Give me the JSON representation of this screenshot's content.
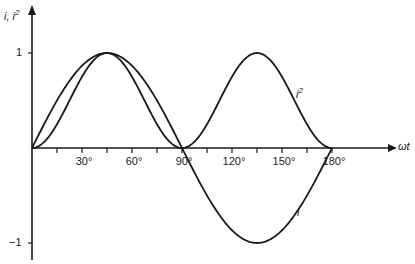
{
  "chart_data": {
    "type": "line",
    "title": "",
    "xlabel": "ωt",
    "ylabel": "i, i²",
    "xlim": [
      0,
      180
    ],
    "ylim": [
      -1,
      1
    ],
    "x_ticks_deg": [
      15,
      30,
      45,
      60,
      75,
      90,
      105,
      120,
      135,
      150,
      165,
      180
    ],
    "x_tick_labels": [
      "30°",
      "60°",
      "90°",
      "120°",
      "150°",
      "180°"
    ],
    "x_tick_label_values": [
      30,
      60,
      90,
      120,
      150,
      180
    ],
    "y_tick_labels": [
      "1",
      "−1"
    ],
    "y_tick_values": [
      1,
      -1
    ],
    "grid": false,
    "series": [
      {
        "name": "i",
        "label": "i",
        "function": "sin(2·ωt)",
        "x": [
          0,
          15,
          30,
          45,
          60,
          75,
          90,
          105,
          120,
          135,
          150,
          165,
          180
        ],
        "values": [
          0,
          0.5,
          0.866,
          1,
          0.866,
          0.5,
          0,
          -0.5,
          -0.866,
          -1,
          -0.866,
          -0.5,
          0
        ]
      },
      {
        "name": "i²",
        "label": "i²",
        "function": "sin²(2·ωt)",
        "x": [
          0,
          15,
          30,
          45,
          60,
          75,
          90,
          105,
          120,
          135,
          150,
          165,
          180
        ],
        "values": [
          0,
          0.25,
          0.75,
          1,
          0.75,
          0.25,
          0,
          0.25,
          0.75,
          1,
          0.75,
          0.25,
          0
        ]
      }
    ],
    "annotations": [
      {
        "text": "i²",
        "near_x_deg": 150,
        "near_y": 0.55
      },
      {
        "text": "i",
        "near_x_deg": 160,
        "near_y": -0.7
      }
    ]
  },
  "labels": {
    "y_axis": "i, i",
    "y_axis_sup": "2",
    "x_axis": "ωt",
    "curve_i": "i",
    "curve_i2": "i",
    "curve_i2_sup": "2"
  },
  "colors": {
    "line": "#1a1a1a",
    "background": "#ffffff"
  }
}
